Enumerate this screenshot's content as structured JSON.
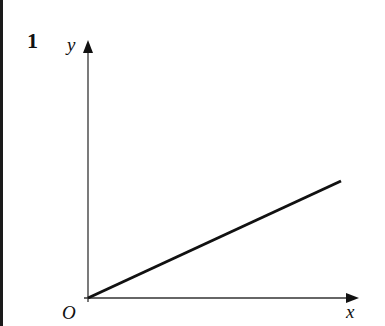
{
  "question": {
    "number": "1"
  },
  "diagram": {
    "type": "line-graph-sketch",
    "axes": {
      "x_label": "x",
      "y_label": "y",
      "origin_label": "O"
    },
    "line": {
      "description": "straight line through origin with positive gradient",
      "start": "origin",
      "end": "upper right"
    },
    "colors": {
      "ink": "#111111",
      "background": "#ffffff"
    }
  }
}
